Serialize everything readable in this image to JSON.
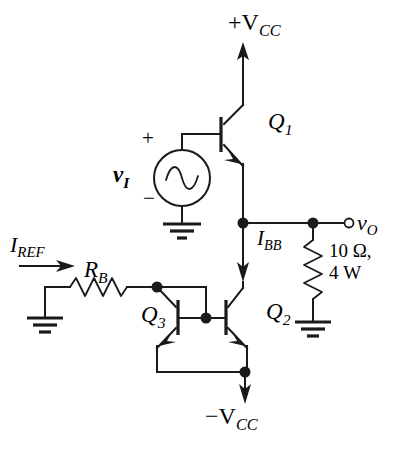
{
  "figure": {
    "type": "circuit-schematic",
    "width": 396,
    "height": 460,
    "background_color": "#ffffff",
    "line_color": "#1a1a1a"
  },
  "labels": {
    "supply_positive": "+V",
    "supply_positive_sub": "CC",
    "supply_negative": "−V",
    "supply_negative_sub": "CC",
    "q1": "Q",
    "q1_sub": "1",
    "q2": "Q",
    "q2_sub": "2",
    "q3": "Q",
    "q3_sub": "3",
    "source_symbol": "v",
    "source_sub": "I",
    "source_plus": "+",
    "source_minus": "−",
    "output_symbol": "v",
    "output_sub": "O",
    "current_bb": "I",
    "current_bb_sub": "BB",
    "current_ref": "I",
    "current_ref_sub": "REF",
    "resistor_bias": "R",
    "resistor_bias_sub": "B",
    "load_line1": "10 Ω,",
    "load_line2": "4 W"
  },
  "components": [
    {
      "name": "Q1",
      "type": "npn-transistor",
      "role": "emitter-follower-upper"
    },
    {
      "name": "Q2",
      "type": "npn-transistor",
      "role": "current-sink-output"
    },
    {
      "name": "Q3",
      "type": "npn-transistor",
      "role": "diode-connected-mirror-reference"
    },
    {
      "name": "RB",
      "type": "resistor",
      "role": "bias-resistor"
    },
    {
      "name": "RL",
      "type": "resistor",
      "value": "10 Ω, 4 W",
      "role": "load"
    },
    {
      "name": "vI",
      "type": "ac-voltage-source",
      "role": "input-signal"
    }
  ],
  "nets": [
    {
      "name": "VCC+",
      "label": "+VCC"
    },
    {
      "name": "VCC-",
      "label": "−VCC"
    },
    {
      "name": "OUT",
      "label": "vO"
    },
    {
      "name": "GND",
      "label": "ground"
    }
  ],
  "icons": {
    "ground": "ground-icon",
    "ac_source": "ac-sine-icon",
    "node": "junction-dot-icon",
    "terminal": "open-terminal-icon",
    "arrow": "current-arrow-icon"
  }
}
